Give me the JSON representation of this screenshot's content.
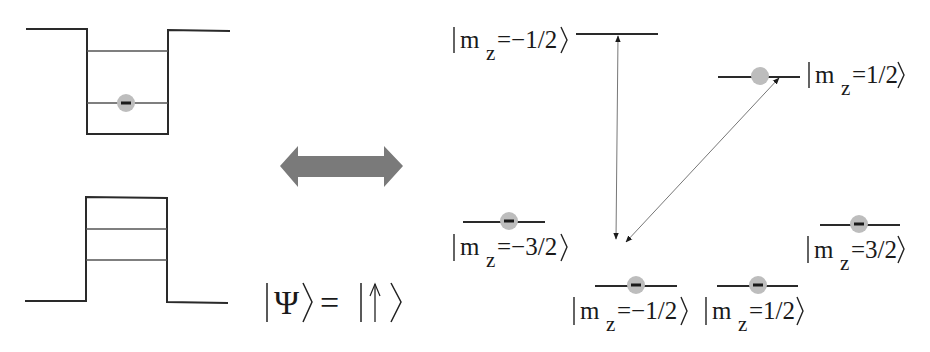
{
  "colors": {
    "line": "#2a2a2a",
    "thin_line": "#555555",
    "electron_fill": "#bdbdbd",
    "electron_minus": "#1a1a1a",
    "double_arrow": "#7a7a7a",
    "transition_arrow": "#777777"
  },
  "left_panel": {
    "conduction_well": {
      "description": "potential well with two levels, electron in lower level",
      "levels": 2,
      "electron_level": "lower"
    },
    "valence_barrier": {
      "description": "potential barrier with two interior levels, empty",
      "levels": 2
    }
  },
  "equivalence_arrow": {
    "icon": "double-headed-arrow"
  },
  "state_equation": {
    "lhs_symbol": "Ψ",
    "equals": "=",
    "rhs_symbol": "↑"
  },
  "energy_levels": [
    {
      "id": "top-left",
      "label_prefix": "m",
      "label_sub": "z",
      "label_value": "=−1/2",
      "occupied": false
    },
    {
      "id": "top-right",
      "label_prefix": "m",
      "label_sub": "z",
      "label_value": "=1/2",
      "occupied": true,
      "minus_visible": false
    },
    {
      "id": "mid-left",
      "label_prefix": "m",
      "label_sub": "z",
      "label_value": "=−3/2",
      "occupied": true
    },
    {
      "id": "mid-right",
      "label_prefix": "m",
      "label_sub": "z",
      "label_value": "=3/2",
      "occupied": true
    },
    {
      "id": "bottom-left",
      "label_prefix": "m",
      "label_sub": "z",
      "label_value": "=−1/2",
      "occupied": true
    },
    {
      "id": "bottom-right",
      "label_prefix": "m",
      "label_sub": "z",
      "label_value": "=1/2",
      "occupied": true
    }
  ],
  "transitions": [
    {
      "from": "top-left",
      "to": "bottom-left-region",
      "style": "double-headed vertical"
    },
    {
      "from": "top-right",
      "to": "bottom-left-region",
      "style": "double-headed diagonal"
    }
  ]
}
